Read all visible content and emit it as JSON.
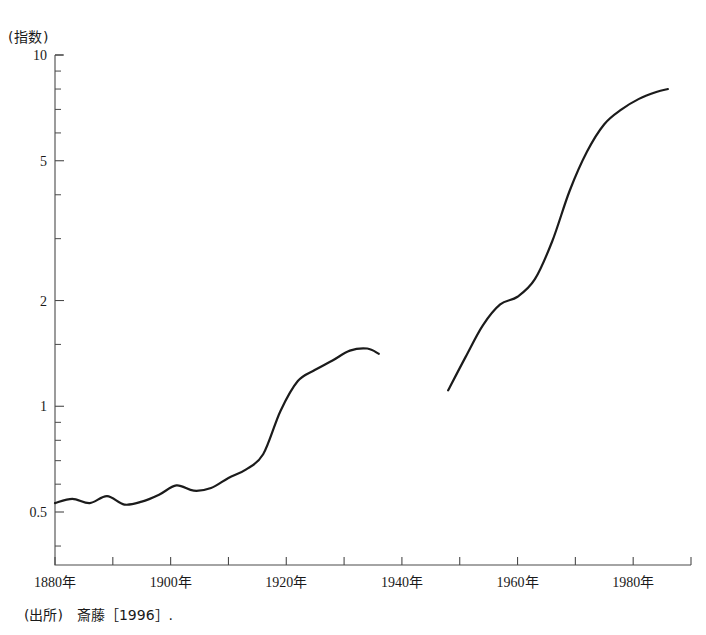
{
  "figure": {
    "unit_label": "(指数)",
    "source_note": "(出所)　斎藤［1996］.",
    "top_partial_title": "",
    "line_color": "#1b1b1b",
    "axis_color": "#4a4a4a",
    "background": "#ffffff"
  },
  "chart_data": {
    "type": "line",
    "title": "",
    "subtitle": "",
    "xlabel": "",
    "ylabel": "(指数)",
    "yscale": "log",
    "ylim": [
      0.35,
      10
    ],
    "xlim": [
      1880,
      1990
    ],
    "grid": false,
    "legend": null,
    "y_ticks_labeled": [
      0.5,
      1,
      2,
      5,
      10
    ],
    "y_tick_labels": [
      "0.5",
      "1",
      "2",
      "5",
      "10"
    ],
    "y_ticks_minor": [
      0.4,
      0.6,
      0.7,
      0.8,
      0.9,
      1.5,
      3,
      4,
      6,
      7,
      8,
      9
    ],
    "x_ticks": [
      1880,
      1890,
      1900,
      1910,
      1920,
      1930,
      1940,
      1950,
      1960,
      1970,
      1980,
      1990
    ],
    "x_tick_labels_shown": [
      "1880年",
      "1900年",
      "1920年",
      "1940年",
      "1960年",
      "1980年"
    ],
    "x_tick_label_years": [
      1880,
      1900,
      1920,
      1940,
      1960,
      1980
    ],
    "series": [
      {
        "name": "prewar",
        "x": [
          1880,
          1883,
          1886,
          1889,
          1892,
          1895,
          1898,
          1901,
          1904,
          1907,
          1910,
          1913,
          1916,
          1919,
          1922,
          1925,
          1928,
          1931,
          1934,
          1936
        ],
        "values": [
          0.53,
          0.545,
          0.53,
          0.555,
          0.525,
          0.535,
          0.56,
          0.595,
          0.575,
          0.585,
          0.625,
          0.66,
          0.73,
          0.97,
          1.18,
          1.27,
          1.35,
          1.44,
          1.46,
          1.41
        ]
      },
      {
        "name": "postwar",
        "x": [
          1948,
          1951,
          1954,
          1957,
          1960,
          1963,
          1966,
          1969,
          1972,
          1975,
          1978,
          1981,
          1984,
          1986
        ],
        "values": [
          1.11,
          1.38,
          1.7,
          1.95,
          2.05,
          2.3,
          2.95,
          4.1,
          5.3,
          6.35,
          7.0,
          7.5,
          7.85,
          8.0
        ]
      }
    ],
    "break_note": "series interrupted between 1936 and 1948 (wartime gap)"
  }
}
